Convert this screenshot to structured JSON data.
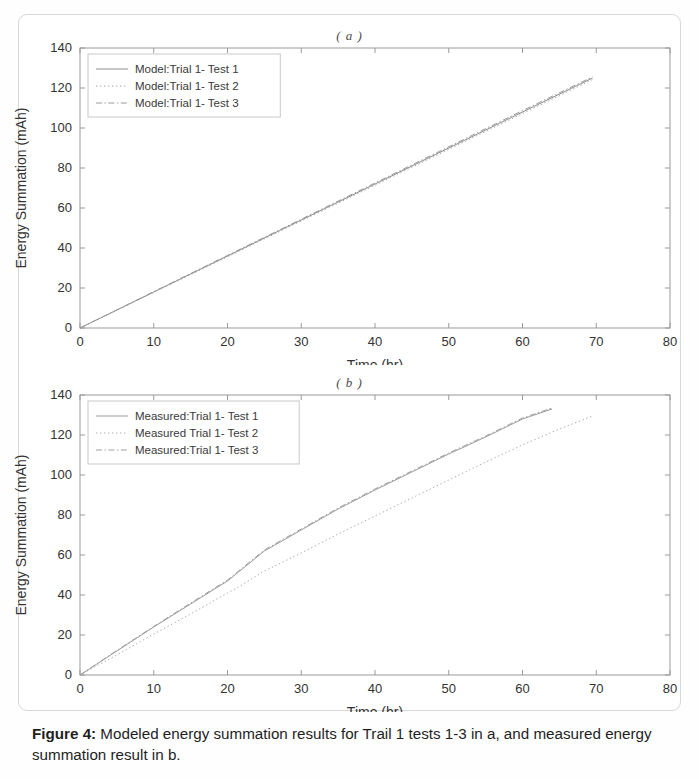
{
  "figure": {
    "caption_label": "Figure 4:",
    "caption_text": " Modeled energy summation results for Trail 1 tests 1-3 in a, and measured energy summation result in b."
  },
  "panels": [
    {
      "id": "a",
      "subplot_title": "( a )",
      "legend_position": "top-left"
    },
    {
      "id": "b",
      "subplot_title": "( b )",
      "legend_position": "top-left"
    }
  ],
  "chart_data": [
    {
      "type": "line",
      "panel": "a",
      "title": "( a )",
      "xlabel": "Time (hr)",
      "ylabel": "Energy Summation (mAh)",
      "xlim": [
        0,
        80
      ],
      "ylim": [
        0,
        140
      ],
      "xticks": [
        0,
        10,
        20,
        30,
        40,
        50,
        60,
        70,
        80
      ],
      "yticks": [
        0,
        20,
        40,
        60,
        80,
        100,
        120,
        140
      ],
      "grid": false,
      "legend": [
        "Model:Trial 1- Test 1",
        "Model:Trial 1- Test 2",
        "Model:Trial 1- Test 3"
      ],
      "series": [
        {
          "name": "Model:Trial 1- Test 1",
          "style": "solid",
          "color": "#8c8c8c",
          "x": [
            0,
            10,
            20,
            30,
            40,
            50,
            60,
            69.5
          ],
          "y": [
            0,
            18.0,
            36.0,
            54.0,
            72.0,
            90.0,
            108.0,
            125.0
          ]
        },
        {
          "name": "Model:Trial 1- Test 2",
          "style": "dotted",
          "color": "#a8a8a8",
          "x": [
            0,
            10,
            20,
            30,
            40,
            50,
            60,
            69.5
          ],
          "y": [
            0,
            17.8,
            35.6,
            53.5,
            71.4,
            89.3,
            107.2,
            124.2
          ]
        },
        {
          "name": "Model:Trial 1- Test 3",
          "style": "dashdot",
          "color": "#9b9b9b",
          "x": [
            0,
            10,
            20,
            30,
            40,
            50,
            60,
            69.5
          ],
          "y": [
            0,
            18.2,
            36.3,
            54.4,
            72.5,
            90.6,
            108.7,
            125.6
          ]
        }
      ]
    },
    {
      "type": "line",
      "panel": "b",
      "title": "( b )",
      "xlabel": "Time (hr)",
      "ylabel": "Energy Summation (mAh)",
      "xlim": [
        0,
        80
      ],
      "ylim": [
        0,
        140
      ],
      "xticks": [
        0,
        10,
        20,
        30,
        40,
        50,
        60,
        70,
        80
      ],
      "yticks": [
        0,
        20,
        40,
        60,
        80,
        100,
        120,
        140
      ],
      "grid": false,
      "legend": [
        "Measured:Trial 1- Test 1",
        "Measured Trial 1- Test 2",
        "Measured:Trial 1- Test 3"
      ],
      "series": [
        {
          "name": "Measured:Trial 1- Test 1",
          "style": "solid",
          "color": "#9c9c9c",
          "x": [
            0,
            5,
            10,
            15,
            20,
            21.5,
            25,
            30,
            35,
            40,
            45,
            50,
            55,
            60,
            64
          ],
          "y": [
            0,
            12.0,
            24.0,
            35.5,
            47.0,
            51.5,
            62.0,
            72.5,
            83.0,
            92.5,
            101.5,
            110.5,
            119.0,
            128.0,
            133.0
          ]
        },
        {
          "name": "Measured Trial 1- Test 2",
          "style": "dotted",
          "color": "#ababab",
          "x": [
            0,
            5,
            10,
            15,
            20,
            21.5,
            25,
            30,
            35,
            40,
            45,
            50,
            55,
            60,
            65,
            69.5
          ],
          "y": [
            0,
            10.0,
            20.5,
            30.5,
            41.0,
            44.0,
            52.0,
            61.0,
            70.5,
            79.5,
            88.5,
            97.5,
            106.5,
            115.0,
            123.0,
            129.5
          ]
        },
        {
          "name": "Measured:Trial 1- Test 3",
          "style": "dashdot",
          "color": "#a0a0a0",
          "x": [
            0,
            5,
            10,
            15,
            20,
            21.5,
            25,
            30,
            35,
            40,
            45,
            50,
            55,
            60,
            64
          ],
          "y": [
            0,
            12.3,
            24.3,
            36.0,
            47.5,
            52.0,
            62.5,
            73.0,
            83.5,
            93.0,
            102.0,
            111.0,
            119.5,
            128.5,
            133.5
          ]
        }
      ]
    }
  ]
}
